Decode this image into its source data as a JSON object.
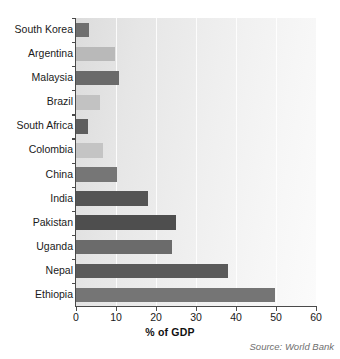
{
  "chart_data": {
    "type": "bar",
    "orientation": "horizontal",
    "title": "",
    "xlabel": "% of GDP",
    "ylabel": "",
    "xlim": [
      0,
      60
    ],
    "xticks": [
      0,
      10,
      20,
      30,
      40,
      50,
      60
    ],
    "grid": true,
    "legend": null,
    "source_note": "Source: World Bank",
    "categories": [
      "South Korea",
      "Argentina",
      "Malaysia",
      "Brazil",
      "South Africa",
      "Colombia",
      "China",
      "India",
      "Pakistan",
      "Uganda",
      "Nepal",
      "Ethiopia"
    ],
    "values": [
      3.2,
      9.8,
      10.8,
      6.0,
      3.0,
      6.8,
      10.3,
      18.0,
      25.0,
      24.0,
      38.0,
      49.8
    ],
    "bar_colors": [
      "#6f6f6f",
      "#b9b9b9",
      "#6a6a6a",
      "#c2c2c2",
      "#5e5e5e",
      "#c4c4c4",
      "#767676",
      "#545454",
      "#4e4e4e",
      "#6b6b6b",
      "#5a5a5a",
      "#757575"
    ]
  },
  "colors": {
    "axis": "#4a4a4a",
    "text": "#1a1a1a",
    "source_text": "#6f6f6f",
    "plot_bg_light": "#fbfbfb",
    "plot_bg_dark": "#dcdcdc",
    "gridline": "#ffffff"
  }
}
